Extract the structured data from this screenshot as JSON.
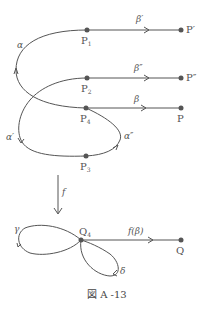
{
  "figure": {
    "caption": "図 A -13",
    "colors": {
      "stroke": "#555555",
      "point": "#555555",
      "text": "#555555"
    },
    "top": {
      "points": [
        {
          "id": "P1",
          "label": "P",
          "sub": "1"
        },
        {
          "id": "P2",
          "label": "P",
          "sub": "2"
        },
        {
          "id": "P4",
          "label": "P",
          "sub": "4"
        },
        {
          "id": "P3",
          "label": "P",
          "sub": "3"
        },
        {
          "id": "Pp",
          "label": "P′"
        },
        {
          "id": "Ppp",
          "label": "P″"
        },
        {
          "id": "P",
          "label": "P"
        }
      ],
      "paths": {
        "beta_prime": "β′",
        "beta_dprime": "β″",
        "beta": "β",
        "alpha": "α",
        "alpha_prime": "α′",
        "alpha_dprime": "α″"
      }
    },
    "map": {
      "label": "f"
    },
    "bottom": {
      "points": [
        {
          "id": "Q4",
          "label": "Q",
          "sub": "4"
        },
        {
          "id": "Q",
          "label": "Q"
        }
      ],
      "paths": {
        "f_beta": "f(β)",
        "gamma": "γ",
        "delta": "δ"
      }
    }
  }
}
